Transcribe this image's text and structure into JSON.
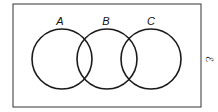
{
  "diagram": {
    "type": "venn",
    "universal_set_symbol": "ℰ",
    "sets": [
      {
        "label": "A",
        "cx": 62,
        "cy": 59,
        "r": 30
      },
      {
        "label": "B",
        "cx": 107,
        "cy": 59,
        "r": 30
      },
      {
        "label": "C",
        "cx": 151,
        "cy": 59,
        "r": 30
      }
    ],
    "frame": {
      "x": 13,
      "y": 4,
      "width": 188,
      "height": 103
    },
    "stroke_color": "#1a1a1a",
    "background": "#ffffff"
  }
}
